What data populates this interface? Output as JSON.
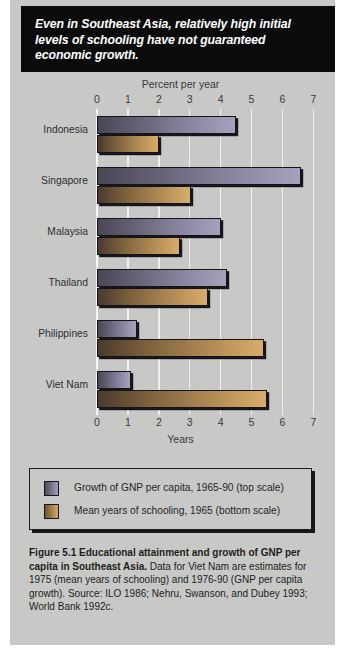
{
  "banner": {
    "headline": "Even in Southeast Asia, relatively high initial levels of schooling have not guaranteed economic growth."
  },
  "chart_data": {
    "type": "bar",
    "orientation": "horizontal",
    "title": "",
    "top_axis_label": "Percent per year",
    "bottom_axis_label": "Years",
    "xlim": [
      0,
      7
    ],
    "ticks": [
      "0",
      "1",
      "2",
      "3",
      "4",
      "5",
      "6",
      "7"
    ],
    "grid": true,
    "legend_position": "below",
    "categories": [
      "Indonesia",
      "Singapore",
      "Malaysia",
      "Thailand",
      "Philippines",
      "Viet Nam"
    ],
    "series": [
      {
        "name": "Growth of GNP per capita, 1965-90 (top scale)",
        "axis": "top",
        "unit": "percent per year",
        "color": "#8d8aa6",
        "values": [
          4.5,
          6.6,
          4.0,
          4.2,
          1.3,
          1.1
        ]
      },
      {
        "name": "Mean years of schooling, 1965 (bottom scale)",
        "axis": "bottom",
        "unit": "years",
        "color": "#c49a5c",
        "values": [
          2.0,
          3.05,
          2.7,
          3.6,
          5.4,
          5.5
        ]
      }
    ]
  },
  "legend": {
    "items": [
      {
        "label": "Growth of GNP per capita, 1965-90 (top scale)"
      },
      {
        "label": "Mean years of schooling, 1965 (bottom scale)"
      }
    ]
  },
  "caption": {
    "bold_part": "Figure 5.1  Educational attainment and growth of GNP per capita in Southeast Asia.",
    "rest": " Data for Viet Nam are estimates for 1975 (mean years of schooling) and 1976-90  (GNP per capita growth). Source: ILO 1986; Nehru, Swanson, and Dubey 1993; World Bank 1992c."
  }
}
